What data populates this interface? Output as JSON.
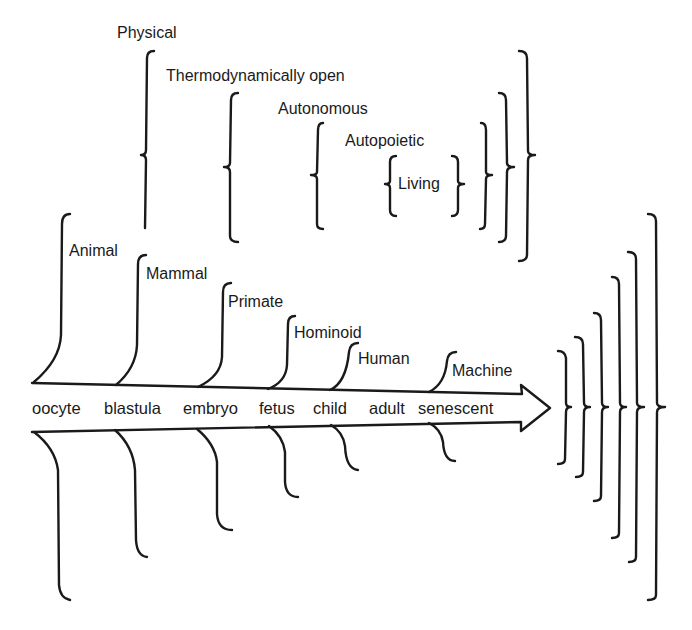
{
  "diagram": {
    "nested_categories": [
      {
        "label": "Physical",
        "level": 0
      },
      {
        "label": "Thermodynamically open",
        "level": 1
      },
      {
        "label": "Autonomous",
        "level": 2
      },
      {
        "label": "Autopoietic",
        "level": 3
      },
      {
        "label": "Living",
        "level": 4
      }
    ],
    "taxa": [
      {
        "label": "Animal",
        "begins_at": "oocyte"
      },
      {
        "label": "Mammal",
        "begins_at": "blastula"
      },
      {
        "label": "Primate",
        "begins_at": "embryo"
      },
      {
        "label": "Hominoid",
        "begins_at": "fetus"
      },
      {
        "label": "Human",
        "begins_at": "child"
      },
      {
        "label": "Machine",
        "begins_at": "senescent"
      }
    ],
    "life_stages": [
      "oocyte",
      "blastula",
      "embryo",
      "fetus",
      "child",
      "adult",
      "senescent"
    ],
    "arrow_direction": "right",
    "colors": {
      "ink": "#1a1a1a",
      "background": "#ffffff"
    }
  }
}
